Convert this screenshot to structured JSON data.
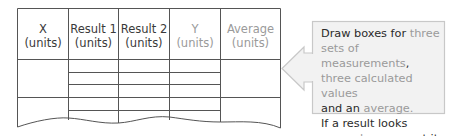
{
  "table": {
    "headers": [
      {
        "label": "X\n(units)",
        "emphasis": "normal"
      },
      {
        "label": "Result 1\n(units)",
        "emphasis": "normal"
      },
      {
        "label": "Result 2\n(units)",
        "emphasis": "normal"
      },
      {
        "label": "Y\n(units)",
        "emphasis": "muted"
      },
      {
        "label": "Average\n(units)",
        "emphasis": "muted"
      }
    ],
    "rows_visible": 2,
    "sub_rows_per_result": 3
  },
  "callout": {
    "lines": [
      [
        {
          "t": "Draw boxes for ",
          "hl": false
        },
        {
          "t": "three",
          "hl": true
        }
      ],
      [
        {
          "t": "sets of measurements",
          "hl": true
        },
        {
          "t": ",",
          "hl": false
        }
      ],
      [
        {
          "t": "three calculated values",
          "hl": true
        }
      ],
      [
        {
          "t": "and an ",
          "hl": false
        },
        {
          "t": "average",
          "hl": true
        },
        {
          "t": ".",
          "hl": true
        }
      ],
      [
        {
          "t": "If a result looks",
          "hl": false
        }
      ],
      [
        {
          "t": "anomalous",
          "hl": true
        },
        {
          "t": ", repeat it.",
          "hl": false
        }
      ]
    ]
  },
  "colors": {
    "line": "#555555",
    "text": "#2a2a2a",
    "muted": "#9a9a9a",
    "callout_bg": "#f2f2f2",
    "callout_border": "#c8c8c8"
  }
}
